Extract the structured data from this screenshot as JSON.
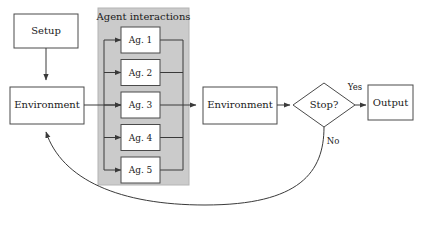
{
  "diagram": {
    "colors": {
      "panel_fill": "#cbcbcb",
      "panel_stroke": "#b4b4b4",
      "box_fill": "#ffffff",
      "box_stroke": "#4a4a4a",
      "line": "#3a3a3a",
      "text": "#1a1a1a",
      "background": "#ffffff"
    },
    "nodes": {
      "setup": {
        "label": "Setup"
      },
      "environment_left": {
        "label": "Environment"
      },
      "environment_right": {
        "label": "Environment"
      },
      "decision": {
        "label": "Stop?"
      },
      "output": {
        "label": "Output"
      }
    },
    "panel": {
      "title": "Agent interactions",
      "agents": [
        {
          "label": "Ag. 1"
        },
        {
          "label": "Ag. 2"
        },
        {
          "label": "Ag. 3"
        },
        {
          "label": "Ag. 4"
        },
        {
          "label": "Ag. 5"
        }
      ]
    },
    "edge_labels": {
      "yes": "Yes",
      "no": "No"
    }
  }
}
